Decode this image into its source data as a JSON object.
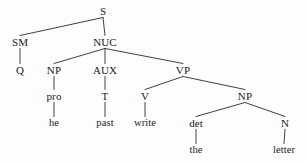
{
  "figure": {
    "kind": "syntax-tree",
    "sentence": "he past write the letter",
    "background_color": "#fdfdfd",
    "line_color": "#2b2b2b",
    "text_color": "#1a1a1a",
    "width": 307,
    "height": 164
  },
  "nodes": [
    {
      "id": "S",
      "label": "S",
      "x": 103,
      "y": 11,
      "type": "nonterminal"
    },
    {
      "id": "SM",
      "label": "SM",
      "x": 20,
      "y": 42,
      "type": "nonterminal"
    },
    {
      "id": "NUC",
      "label": "NUC",
      "x": 105,
      "y": 42,
      "type": "nonterminal"
    },
    {
      "id": "Q",
      "label": "Q",
      "x": 20,
      "y": 70,
      "type": "nonterminal"
    },
    {
      "id": "NP1",
      "label": "NP",
      "x": 54,
      "y": 70,
      "type": "nonterminal"
    },
    {
      "id": "AUX",
      "label": "AUX",
      "x": 105,
      "y": 70,
      "type": "nonterminal"
    },
    {
      "id": "VP",
      "label": "VP",
      "x": 183,
      "y": 70,
      "type": "nonterminal"
    },
    {
      "id": "pro",
      "label": "pro",
      "x": 54,
      "y": 96,
      "type": "nonterminal"
    },
    {
      "id": "T",
      "label": "T",
      "x": 105,
      "y": 96,
      "type": "nonterminal"
    },
    {
      "id": "V",
      "label": "V",
      "x": 145,
      "y": 96,
      "type": "nonterminal"
    },
    {
      "id": "NP2",
      "label": "NP",
      "x": 245,
      "y": 96,
      "type": "nonterminal"
    },
    {
      "id": "he",
      "label": "he",
      "x": 54,
      "y": 123,
      "type": "terminal"
    },
    {
      "id": "past",
      "label": "past",
      "x": 105,
      "y": 123,
      "type": "terminal"
    },
    {
      "id": "write",
      "label": "write",
      "x": 145,
      "y": 123,
      "type": "terminal"
    },
    {
      "id": "det",
      "label": "det",
      "x": 196,
      "y": 123,
      "type": "nonterminal"
    },
    {
      "id": "N",
      "label": "N",
      "x": 285,
      "y": 123,
      "type": "nonterminal"
    },
    {
      "id": "the",
      "label": "the",
      "x": 196,
      "y": 150,
      "type": "terminal"
    },
    {
      "id": "letter",
      "label": "letter",
      "x": 284,
      "y": 150,
      "type": "terminal"
    }
  ],
  "edges": [
    {
      "from": "S",
      "to": "SM"
    },
    {
      "from": "S",
      "to": "NUC"
    },
    {
      "from": "SM",
      "to": "Q"
    },
    {
      "from": "NUC",
      "to": "NP1"
    },
    {
      "from": "NUC",
      "to": "AUX"
    },
    {
      "from": "NUC",
      "to": "VP"
    },
    {
      "from": "NP1",
      "to": "pro"
    },
    {
      "from": "AUX",
      "to": "T"
    },
    {
      "from": "VP",
      "to": "V"
    },
    {
      "from": "VP",
      "to": "NP2"
    },
    {
      "from": "pro",
      "to": "he"
    },
    {
      "from": "T",
      "to": "past"
    },
    {
      "from": "V",
      "to": "write"
    },
    {
      "from": "NP2",
      "to": "det"
    },
    {
      "from": "NP2",
      "to": "N"
    },
    {
      "from": "det",
      "to": "the"
    },
    {
      "from": "N",
      "to": "letter"
    }
  ]
}
